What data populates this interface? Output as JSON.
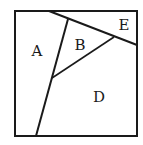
{
  "diagram": {
    "type": "partitioned-square",
    "stroke_color": "#1a1a1a",
    "background": "#ffffff",
    "square": {
      "x1": 15,
      "y1": 11,
      "x2": 137,
      "y2": 136
    },
    "lines": [
      {
        "id": "top-diagonal",
        "from": [
          49,
          11
        ],
        "to": [
          137,
          45
        ]
      },
      {
        "id": "a-divider",
        "from": [
          36,
          136
        ],
        "to": [
          68,
          19
        ]
      },
      {
        "id": "b-d-divider",
        "from": [
          52,
          78
        ],
        "to": [
          114,
          37
        ]
      }
    ],
    "regions": [
      {
        "label": "A",
        "x": 37,
        "y": 56
      },
      {
        "label": "B",
        "x": 80,
        "y": 50
      },
      {
        "label": "E",
        "x": 124,
        "y": 30
      },
      {
        "label": "D",
        "x": 99,
        "y": 102
      }
    ]
  }
}
